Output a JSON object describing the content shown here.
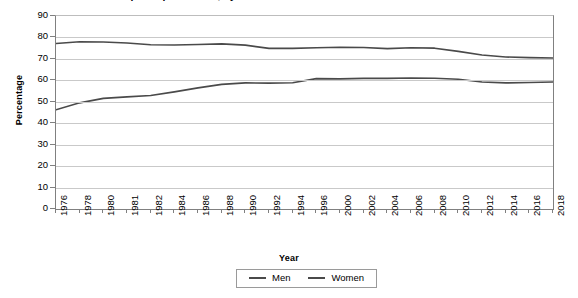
{
  "chart_data": {
    "type": "line",
    "title": "Labour force participation rate, by sex",
    "xlabel": "Year",
    "ylabel": "Percentage",
    "ylim": [
      0,
      90
    ],
    "ytick_step": 10,
    "yticks": [
      0,
      10,
      20,
      30,
      40,
      50,
      60,
      70,
      80,
      90
    ],
    "grid": "horizontal",
    "legend_position": "bottom-center",
    "categories": [
      "1976",
      "1978",
      "1980",
      "1981",
      "1982",
      "1984",
      "1986",
      "1988",
      "1990",
      "1992",
      "1994",
      "1996",
      "2000",
      "2002",
      "2004",
      "2006",
      "2008",
      "2010",
      "2012",
      "2014",
      "2016",
      "2018"
    ],
    "series": [
      {
        "name": "Men",
        "color": "#4a4a4a",
        "values": [
          77.2,
          78.0,
          77.9,
          77.4,
          76.6,
          76.5,
          76.7,
          77.0,
          76.4,
          74.9,
          74.9,
          75.2,
          75.4,
          75.3,
          74.8,
          75.2,
          75.0,
          73.5,
          71.8,
          70.9,
          70.6,
          70.4
        ]
      },
      {
        "name": "Women",
        "color": "#4a4a4a",
        "values": [
          46.3,
          49.5,
          51.6,
          52.3,
          52.9,
          54.6,
          56.5,
          58.1,
          58.8,
          58.7,
          58.9,
          60.8,
          60.7,
          60.9,
          60.9,
          61.1,
          61.0,
          60.5,
          59.2,
          58.8,
          59.0,
          59.2
        ]
      }
    ]
  },
  "legend": {
    "items": [
      {
        "label": "Men"
      },
      {
        "label": "Women"
      }
    ]
  },
  "colors": {
    "line": "#4a4a4a",
    "gridline": "#c9c9c9",
    "axis": "#808080"
  }
}
